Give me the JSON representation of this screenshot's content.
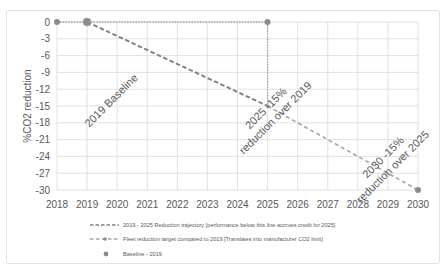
{
  "colors": {
    "grid": "#d9d9d9",
    "text": "#595959",
    "trajectory_line": "#7f7f7f",
    "fleet_line": "#a5a5a5",
    "marker": "#8c8c8c"
  },
  "chart_data": {
    "type": "line",
    "title": "",
    "xlabel": "",
    "ylabel": "%CO2 reduction",
    "xlim": [
      2018,
      2030
    ],
    "ylim": [
      -30,
      0
    ],
    "x_ticks": [
      2018,
      2019,
      2020,
      2021,
      2022,
      2023,
      2024,
      2025,
      2026,
      2027,
      2028,
      2029,
      2030
    ],
    "y_ticks": [
      0,
      -3,
      -6,
      -9,
      -12,
      -15,
      -18,
      -21,
      -24,
      -27,
      -30
    ],
    "grid": true,
    "legend_position": "bottom",
    "series": [
      {
        "name": "2019 - 2025 Reduction trajectory [performance below this line accrues credit for 2025]",
        "style": "dashed",
        "points": [
          [
            2019,
            0
          ],
          [
            2025,
            -15
          ]
        ]
      },
      {
        "name": "Fleet reduction target compared to 2019 [Translates into manufacturer CO2 limit]",
        "style": "dashed-with-markers",
        "points": [
          [
            2018,
            0
          ],
          [
            2025,
            0
          ],
          [
            2025,
            -15
          ],
          [
            2030,
            -30
          ]
        ]
      },
      {
        "name": "Baseline - 2019",
        "style": "marker",
        "points": [
          [
            2019,
            0
          ]
        ]
      }
    ],
    "annotations": [
      {
        "lines": [
          "2019 Baseline"
        ],
        "anchor": [
          2019.8,
          -14
        ],
        "rotation": -45
      },
      {
        "lines": [
          "2025 -15%",
          "reduction over 2019"
        ],
        "anchor": [
          2025.1,
          -16.25
        ],
        "rotation": -45
      },
      {
        "lines": [
          "2030 -15%",
          "reduction over 2025"
        ],
        "anchor": [
          2029.0,
          -25
        ],
        "rotation": -45
      }
    ]
  },
  "legend": {
    "items": [
      {
        "label": "2019 - 2025 Reduction trajectory [performance below this line accrues credit for 2025]"
      },
      {
        "label": "Fleet reduction target compared to 2019 [Translates into manufacturer CO2 limit]"
      },
      {
        "label": "Baseline - 2019"
      }
    ]
  }
}
